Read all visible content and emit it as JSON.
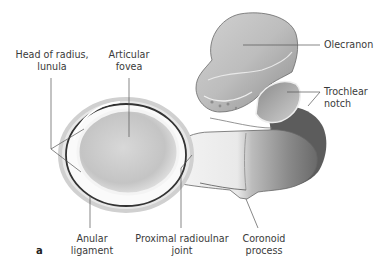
{
  "figure": {
    "letter": "a",
    "labels": {
      "head_of_radius": {
        "line1": "Head of radius,",
        "line2": "lunula"
      },
      "articular_fovea": {
        "line1": "Articular",
        "line2": "fovea"
      },
      "olecranon": {
        "line1": "Olecranon"
      },
      "trochlear_notch": {
        "line1": "Trochlear",
        "line2": "notch"
      },
      "anular_ligament": {
        "line1": "Anular",
        "line2": "ligament"
      },
      "proximal_radioulnar_joint": {
        "line1": "Proximal radioulnar",
        "line2": "joint"
      },
      "coronoid_process": {
        "line1": "Coronoid",
        "line2": "process"
      }
    },
    "colors": {
      "label_text": "#3a3a3a",
      "leader_line": "#555555",
      "bone_light": "#f2f2f2",
      "bone_mid": "#bdbdbd",
      "bone_dark": "#6e6e6e"
    }
  }
}
